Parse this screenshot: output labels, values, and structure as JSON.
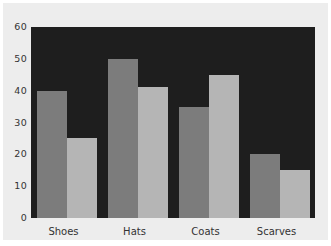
{
  "chart_data": {
    "type": "bar",
    "title": "",
    "xlabel": "",
    "ylabel": "",
    "categories": [
      "Shoes",
      "Hats",
      "Coats",
      "Scarves"
    ],
    "series": [
      {
        "name": "series-1-dark",
        "color": "#7c7c7c",
        "values": [
          40,
          50,
          35,
          20
        ]
      },
      {
        "name": "series-2-light",
        "color": "#b5b5b5",
        "values": [
          25,
          41,
          45,
          15
        ]
      }
    ],
    "ylim": [
      0,
      60
    ],
    "yticks": [
      0,
      10,
      20,
      30,
      40,
      50,
      60
    ],
    "grid": false,
    "legend": "none",
    "colors": {
      "plot_background": "#1e1e1e",
      "figure_background": "#ededed",
      "page_background": "#ffffff",
      "text": "#333333"
    }
  }
}
